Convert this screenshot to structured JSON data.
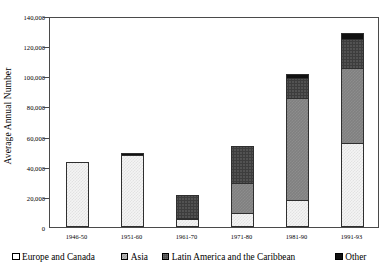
{
  "chart_data": {
    "type": "bar",
    "title": "",
    "subtitle": "",
    "xlabel": "",
    "ylabel": "Average Annual Number",
    "ylim": [
      0,
      140000
    ],
    "ytick_values": [
      0,
      20000,
      40000,
      60000,
      80000,
      100000,
      120000,
      140000
    ],
    "ytick_labels": [
      "0",
      "20,000",
      "40,000",
      "60,000",
      "80,000",
      "100,000",
      "120,000",
      "140,000"
    ],
    "grid": false,
    "stacked": true,
    "legend_position": "bottom",
    "categories": [
      "1946-50",
      "1951-60",
      "1961-70",
      "1971-80",
      "1981-90",
      "1991-93"
    ],
    "series": [
      {
        "name": "Europe and Canada",
        "key": "europe",
        "color": "#f4f4f4",
        "values": [
          43000,
          48000,
          5000,
          9000,
          18000,
          56000
        ]
      },
      {
        "name": "Asia",
        "key": "asia",
        "color": "#808080",
        "values": [
          0,
          0,
          1000,
          21000,
          68000,
          50000
        ]
      },
      {
        "name": "Latin America and the Caribbean",
        "key": "latin",
        "color": "#3d3d3d",
        "values": [
          0,
          0,
          16000,
          25000,
          14000,
          20000
        ]
      },
      {
        "name": "Other",
        "key": "other",
        "color": "#111111",
        "values": [
          0,
          2000,
          0,
          0,
          3500,
          5000
        ]
      }
    ],
    "totals": [
      43000,
      50000,
      22000,
      55000,
      103500,
      131000
    ]
  },
  "legend": {
    "items": [
      {
        "label": "Europe and Canada",
        "key": "europe"
      },
      {
        "label": "Asia",
        "key": "asia"
      },
      {
        "label": "Latin America and the Caribbean",
        "key": "latin"
      },
      {
        "label": "Other",
        "key": "other"
      }
    ]
  }
}
